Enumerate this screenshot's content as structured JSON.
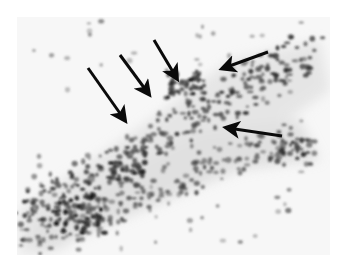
{
  "figure": {
    "type": "grayscale histology micrograph",
    "background_color": "#ffffff",
    "arrow_color": "#0a0a0a",
    "arrows": [
      {
        "id": 1,
        "direction": "down-right",
        "from": [
          88,
          68
        ],
        "to": [
          128,
          124
        ]
      },
      {
        "id": 2,
        "direction": "down-right",
        "from": [
          120,
          55
        ],
        "to": [
          152,
          98
        ]
      },
      {
        "id": 3,
        "direction": "down-right",
        "from": [
          154,
          40
        ],
        "to": [
          180,
          82
        ]
      },
      {
        "id": 4,
        "direction": "left",
        "from": [
          268,
          52
        ],
        "to": [
          218,
          70
        ]
      },
      {
        "id": 5,
        "direction": "left",
        "from": [
          282,
          136
        ],
        "to": [
          222,
          127
        ]
      }
    ]
  }
}
